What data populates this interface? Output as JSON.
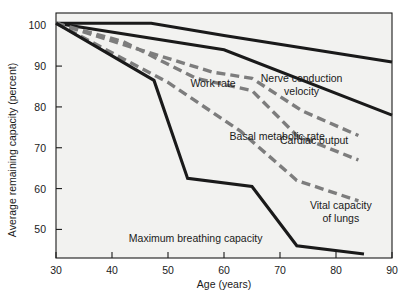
{
  "chart_data": {
    "type": "line",
    "title": "",
    "xlabel": "Age (years)",
    "ylabel": "Average remaining capacity (percent)",
    "xlim": [
      30,
      90
    ],
    "ylim": [
      43,
      103
    ],
    "xticks": [
      30,
      40,
      50,
      60,
      70,
      80,
      90
    ],
    "yticks": [
      50,
      60,
      70,
      80,
      90,
      100
    ],
    "xtick_labels": [
      "30",
      "40",
      "50",
      "60",
      "70",
      "80",
      "90"
    ],
    "ytick_labels": [
      "50",
      "60",
      "70",
      "80",
      "90",
      "100"
    ],
    "grid": false,
    "legend_position": "inline-labels",
    "colors": {
      "solid": "#1a1a1a",
      "dashed": "#7d7d7d",
      "plot_background": "#f2f2f0"
    },
    "series": [
      {
        "name": "Nerve conduction velocity",
        "style": "solid",
        "label_x": 66,
        "label_y": 86,
        "label_anchor": "start",
        "label_lines": [
          "Nerve conduction",
          "velocity"
        ],
        "x": [
          30,
          47,
          60,
          90
        ],
        "y": [
          100.5,
          100.5,
          97.5,
          91.0
        ]
      },
      {
        "name": "Basal metabolic rate",
        "style": "solid",
        "label_x": 61,
        "label_y": 72,
        "label_anchor": "start",
        "label_lines": [
          "Basal metabolic rate"
        ],
        "x": [
          30,
          60,
          90
        ],
        "y": [
          100.5,
          94.0,
          78.0
        ]
      },
      {
        "name": "Work rate",
        "style": "dashed",
        "label_x": 54,
        "label_y": 85,
        "label_anchor": "start",
        "label_lines": [
          "Work rate"
        ],
        "x": [
          30,
          45,
          58,
          65,
          74,
          84
        ],
        "y": [
          100.5,
          94.0,
          88.5,
          87.0,
          79.0,
          73.0
        ]
      },
      {
        "name": "Cardiac output",
        "style": "dashed",
        "label_x": 70,
        "label_y": 71,
        "label_anchor": "start",
        "label_lines": [
          "Cardiac output"
        ],
        "x": [
          30,
          42,
          55,
          65,
          73,
          84
        ],
        "y": [
          100.5,
          96.0,
          87.0,
          84.0,
          73.0,
          67.0
        ]
      },
      {
        "name": "Vital capacity of lungs",
        "style": "dashed",
        "label_x": 73,
        "label_y": 55,
        "label_anchor": "start",
        "label_lines": [
          "Vital capacity",
          "of lungs"
        ],
        "x": [
          30,
          50,
          63,
          73,
          84
        ],
        "y": [
          100.5,
          86.0,
          74.0,
          62.0,
          57.0
        ]
      },
      {
        "name": "Maximum breathing capacity",
        "style": "solid",
        "label_x": 43,
        "label_y": 47,
        "label_anchor": "start",
        "label_lines": [
          "Maximum breathing capacity"
        ],
        "x": [
          30,
          47.5,
          53.5,
          65,
          73,
          85
        ],
        "y": [
          100.5,
          86.5,
          62.5,
          60.5,
          46.0,
          44.0
        ]
      }
    ]
  },
  "axes": {
    "y_axis_label": "Average remaining capacity (percent)",
    "x_axis_label": "Age (years)"
  }
}
